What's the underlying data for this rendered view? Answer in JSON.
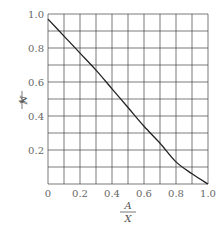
{
  "chart_data": {
    "type": "line",
    "title": "",
    "xlabel": "A/X",
    "ylabel": "N/k",
    "xlabel_parts": {
      "numerator": "A",
      "denominator": "X"
    },
    "ylabel_parts": {
      "numerator": "N",
      "denominator": "k"
    },
    "xlim": [
      0,
      1.0
    ],
    "ylim": [
      0,
      1.0
    ],
    "grid": true,
    "grid_step": 0.1,
    "x_ticks": [
      "0",
      "0.2",
      "0.4",
      "0.6",
      "0.8",
      "1.0"
    ],
    "y_ticks": [
      "0.2",
      "0.4",
      "0.6",
      "0.8",
      "1.0"
    ],
    "series": [
      {
        "name": "N/k",
        "x": [
          0.0,
          0.1,
          0.2,
          0.3,
          0.4,
          0.5,
          0.6,
          0.7,
          0.8,
          0.9,
          1.0
        ],
        "values": [
          0.97,
          0.87,
          0.77,
          0.67,
          0.56,
          0.45,
          0.34,
          0.24,
          0.13,
          0.06,
          0.0
        ]
      }
    ]
  },
  "colors": {
    "grid": "#444444",
    "curve": "#222222",
    "text": "#666666"
  }
}
